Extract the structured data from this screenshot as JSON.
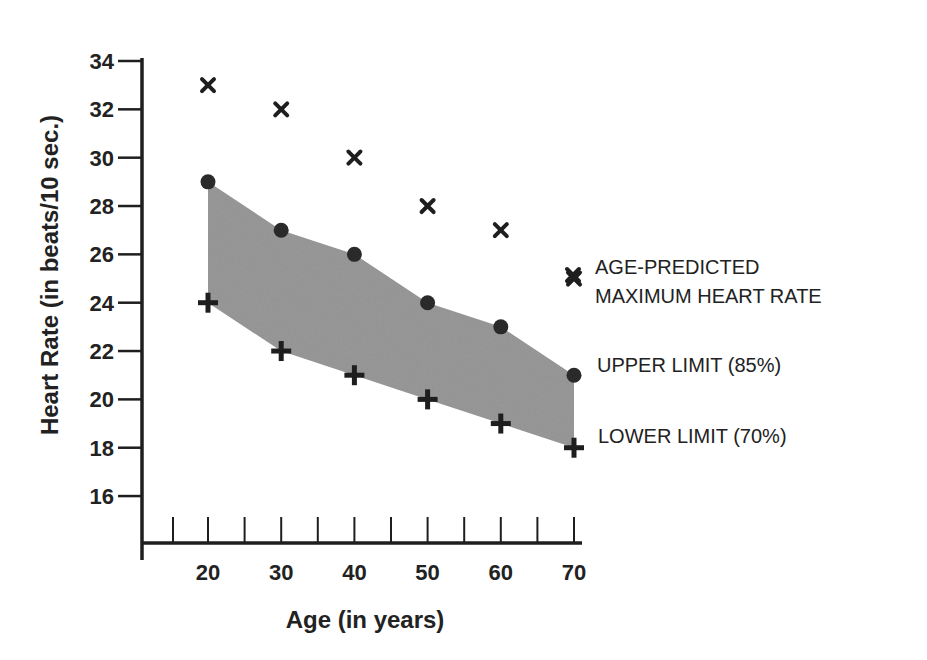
{
  "chart_data": {
    "type": "scatter",
    "title": "",
    "xlabel": "Age (in years)",
    "ylabel": "Heart Rate (in beats/10 sec.)",
    "x": [
      20,
      30,
      40,
      50,
      60,
      70
    ],
    "x_ticks": [
      20,
      30,
      40,
      50,
      60,
      70
    ],
    "x_minor_ticks": [
      15,
      20,
      25,
      30,
      35,
      40,
      45,
      50,
      55,
      60,
      65,
      70
    ],
    "y_ticks": [
      16,
      18,
      20,
      22,
      24,
      26,
      28,
      30,
      32,
      34
    ],
    "ylim": [
      16,
      34
    ],
    "xlim": [
      15,
      70
    ],
    "grid": false,
    "legend_position": "right, inline labels",
    "series": [
      {
        "name": "AGE-PREDICTED MAXIMUM HEART RATE",
        "marker": "x",
        "values": [
          33,
          32,
          30,
          28,
          27,
          25
        ]
      },
      {
        "name": "UPPER LIMIT (85%)",
        "marker": "circle",
        "values": [
          29,
          27,
          26,
          24,
          23,
          21
        ]
      },
      {
        "name": "LOWER LIMIT (70%)",
        "marker": "plus",
        "values": [
          24,
          22,
          21,
          20,
          19,
          18
        ]
      }
    ],
    "shaded_band": {
      "between": [
        "UPPER LIMIT (85%)",
        "LOWER LIMIT (70%)"
      ],
      "color": "#9a9a9a"
    }
  },
  "legend": {
    "max_line1": "AGE-PREDICTED",
    "max_line2": "MAXIMUM HEART RATE",
    "upper": "UPPER LIMIT (85%)",
    "lower": "LOWER LIMIT (70%)"
  },
  "labels": {
    "xlabel": "Age (in years)",
    "ylabel": "Heart Rate (in beats/10 sec.)"
  },
  "colors": {
    "ink": "#1e1e1e",
    "band": "#9a9a9a"
  }
}
